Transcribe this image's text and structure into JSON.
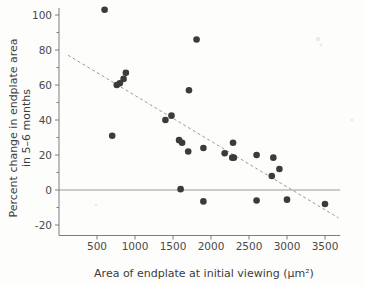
{
  "figure": {
    "name": "scatter-plot-endplate-area",
    "background": "#fdfdfc",
    "point_color": "#3b3b3b",
    "line_color": "#9b9b9b",
    "axis_color": "#7d7d7d"
  },
  "chart_data": {
    "type": "scatter",
    "title": "",
    "xlabel": "Area of endplate at initial viewing (µm²)",
    "ylabel": "Percent change in endplate area in 5–6 months",
    "ylabel_line1": "Percent change in endplate area",
    "ylabel_line2": "in 5–6 months",
    "xlim": [
      0,
      3700
    ],
    "ylim": [
      -26,
      104
    ],
    "xticks": [
      500,
      1000,
      1500,
      2000,
      2500,
      3000,
      3500
    ],
    "xtick_labels": [
      "500",
      "1000",
      "1500",
      "2000",
      "2500",
      "3000",
      "3500"
    ],
    "yticks": [
      -20,
      0,
      20,
      40,
      60,
      80,
      100
    ],
    "ytick_labels": [
      "-20",
      "0",
      "20",
      "40",
      "60",
      "80",
      "100"
    ],
    "yticks_minor": [
      -10,
      10,
      30,
      50,
      70,
      90
    ],
    "grid": false,
    "legend": null,
    "zero_reference_line": {
      "y": 0,
      "style": "solid",
      "color": "#9a9a9a",
      "x_from": 0,
      "x_to": 3700
    },
    "fit_line": {
      "style": "dashed",
      "color": "#9b9b9b",
      "x_from": 120,
      "y_from": 77,
      "x_to": 3680,
      "y_to": -16,
      "slope_per_unit": -0.0261,
      "intercept": 80.1
    },
    "x": [
      600,
      700,
      760,
      800,
      850,
      880,
      1400,
      1480,
      1580,
      1600,
      1620,
      1700,
      1710,
      1810,
      1900,
      1900,
      2180,
      2280,
      2290,
      2300,
      2600,
      2600,
      2800,
      2820,
      2900,
      3000,
      3500
    ],
    "y": [
      103,
      31,
      60,
      61,
      63.5,
      67,
      40,
      42.5,
      28.5,
      0.5,
      27,
      22,
      57,
      86,
      24,
      -6.5,
      21,
      18.5,
      27,
      18.5,
      20,
      -6,
      8,
      18.5,
      12,
      -5.5,
      -8
    ],
    "points": [
      {
        "x": 600,
        "y": 103
      },
      {
        "x": 700,
        "y": 31
      },
      {
        "x": 760,
        "y": 60
      },
      {
        "x": 800,
        "y": 61
      },
      {
        "x": 850,
        "y": 63.5
      },
      {
        "x": 880,
        "y": 67
      },
      {
        "x": 1400,
        "y": 40
      },
      {
        "x": 1480,
        "y": 42.5
      },
      {
        "x": 1580,
        "y": 28.5
      },
      {
        "x": 1600,
        "y": 0.5
      },
      {
        "x": 1620,
        "y": 27
      },
      {
        "x": 1700,
        "y": 22
      },
      {
        "x": 1710,
        "y": 57
      },
      {
        "x": 1810,
        "y": 86
      },
      {
        "x": 1900,
        "y": 24
      },
      {
        "x": 1900,
        "y": -6.5
      },
      {
        "x": 2180,
        "y": 21
      },
      {
        "x": 2280,
        "y": 18.5
      },
      {
        "x": 2290,
        "y": 27
      },
      {
        "x": 2300,
        "y": 18.5
      },
      {
        "x": 2600,
        "y": 20
      },
      {
        "x": 2600,
        "y": -6
      },
      {
        "x": 2800,
        "y": 8
      },
      {
        "x": 2820,
        "y": 18.5
      },
      {
        "x": 2900,
        "y": 12
      },
      {
        "x": 3000,
        "y": -5.5
      },
      {
        "x": 3500,
        "y": -8
      }
    ],
    "n_points": 27,
    "marker": "filled-circle",
    "marker_size_px": 4.6
  }
}
